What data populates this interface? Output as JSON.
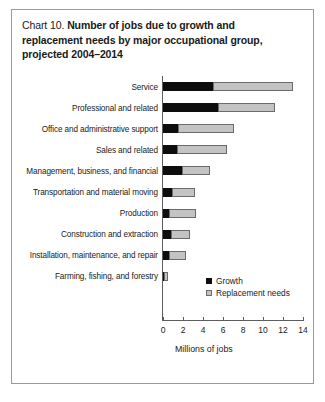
{
  "figure": {
    "label": "Chart 10.",
    "title_lines": [
      "Number of jobs due to growth and",
      "replacement needs by major occupational group,",
      "projected 2004–2014"
    ]
  },
  "chart_data": {
    "type": "bar",
    "orientation": "horizontal",
    "stacked": true,
    "title": "Chart 10. Number of jobs due to growth and replacement needs by major occupational group, projected 2004–2014",
    "xlabel": "Millions of jobs",
    "ylabel": "",
    "xlim": [
      0,
      14
    ],
    "xticks": [
      0,
      2,
      4,
      6,
      8,
      10,
      12,
      14
    ],
    "xtick_labels": [
      "0",
      "2",
      "4",
      "6",
      "8",
      "10",
      "12",
      "14"
    ],
    "grid": false,
    "legend_position": "inside-bottom-left",
    "categories": [
      "Service",
      "Professional and related",
      "Office and administrative support",
      "Sales and related",
      "Management, business, and financial",
      "Transportation and material moving",
      "Production",
      "Construction and extraction",
      "Installation, maintenance, and repair",
      "Farming, fishing, and forestry"
    ],
    "series": [
      {
        "name": "Growth",
        "color": "#0d0d0d",
        "values": [
          5.0,
          5.5,
          1.5,
          1.4,
          1.9,
          0.9,
          0.6,
          0.8,
          0.6,
          0.1
        ]
      },
      {
        "name": "Replacement needs",
        "color": "#c3c3c3",
        "values": [
          8.0,
          5.7,
          5.6,
          5.0,
          2.8,
          2.3,
          2.7,
          1.9,
          1.7,
          0.4
        ]
      }
    ],
    "totals": [
      13.0,
      11.2,
      7.1,
      6.4,
      4.7,
      3.2,
      3.3,
      2.7,
      2.3,
      0.5
    ]
  },
  "legend": {
    "items": [
      {
        "label": "Growth",
        "swatch": "growth"
      },
      {
        "label": "Replacement needs",
        "swatch": "replacement"
      }
    ]
  }
}
